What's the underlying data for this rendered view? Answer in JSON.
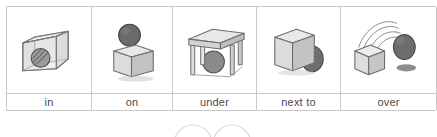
{
  "worksheet": {
    "title": "Prepositions of place picture table",
    "columns": 5
  },
  "colors": {
    "border": "#c9c9c9",
    "label_text": "#4a4a4a",
    "cube_top": "#e8e8e8",
    "cube_left": "#d2d2d2",
    "cube_right": "#bcbcbc",
    "cube_outline": "#6e6e6e",
    "sphere_fill": "#6b6b6b",
    "sphere_outline": "#474747",
    "glass_fill": "#e3e3e3",
    "glass_outline": "#7a7a7a",
    "shadow": "#8d8d8d",
    "motion_line": "#8a8a8a",
    "faint_mark": "#d8d8d8",
    "page_background": "#ffffff"
  },
  "cells": [
    {
      "id": "in",
      "label": "in",
      "icon": "ball-inside-transparent-box-icon",
      "description": "striped ball inside an open transparent box"
    },
    {
      "id": "on",
      "label": "on",
      "icon": "ball-on-top-of-cube-icon",
      "description": "dark sphere resting on top of a cube"
    },
    {
      "id": "under",
      "label": "under",
      "icon": "ball-under-table-icon",
      "description": "ball underneath a table-like open frame"
    },
    {
      "id": "next-to",
      "label": "next to",
      "icon": "ball-beside-cube-icon",
      "description": "sphere standing beside a cube"
    },
    {
      "id": "over",
      "label": "over",
      "icon": "ball-flying-over-cube-icon",
      "description": "ball arcing over a cube with motion lines and a shadow"
    }
  ],
  "bottom_marks": {
    "name": "partial-circle-marks",
    "count": 2,
    "description": "two faint arcs (tops of circles) cropped by the bottom edge"
  }
}
